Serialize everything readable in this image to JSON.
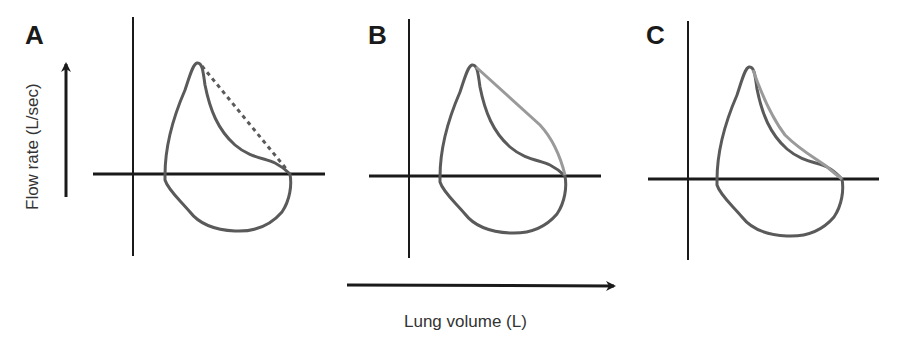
{
  "figure": {
    "panels": [
      {
        "label": "A",
        "annotation": "dotted line from peak flow to residual volume"
      },
      {
        "label": "B",
        "annotation": "straight light-gray line from peak flow to residual volume"
      },
      {
        "label": "C",
        "annotation": "light-gray concave curve close to the measured expiratory limb"
      }
    ],
    "y_axis_label": "Flow rate (L/sec)",
    "x_axis_label": "Lung volume (L)"
  },
  "colors": {
    "axis": "#1a1a1a",
    "loop": "#5a5a5a",
    "reference": "#9a9a9a",
    "dotted": "#5a5a5a",
    "background": "#ffffff"
  }
}
